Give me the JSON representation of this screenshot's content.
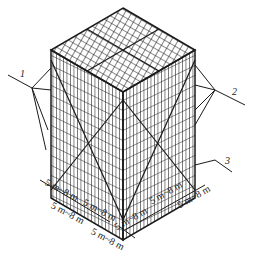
{
  "figure": {
    "type": "isometric scaffolding frame diagram",
    "callouts": [
      {
        "id": "1",
        "label": "1"
      },
      {
        "id": "2",
        "label": "2"
      },
      {
        "id": "3",
        "label": "3"
      }
    ],
    "dimensions": {
      "left_edge": [
        "5 m~8 m",
        "5 m~8 m",
        "5 m~8 m"
      ],
      "right_edge": [
        "5 m~8 m",
        "5 m~8 m",
        "5 m~8 m"
      ],
      "corner": "5 m~8 m"
    },
    "colors": {
      "line": "#1a1a1a",
      "background": "#ffffff"
    }
  }
}
